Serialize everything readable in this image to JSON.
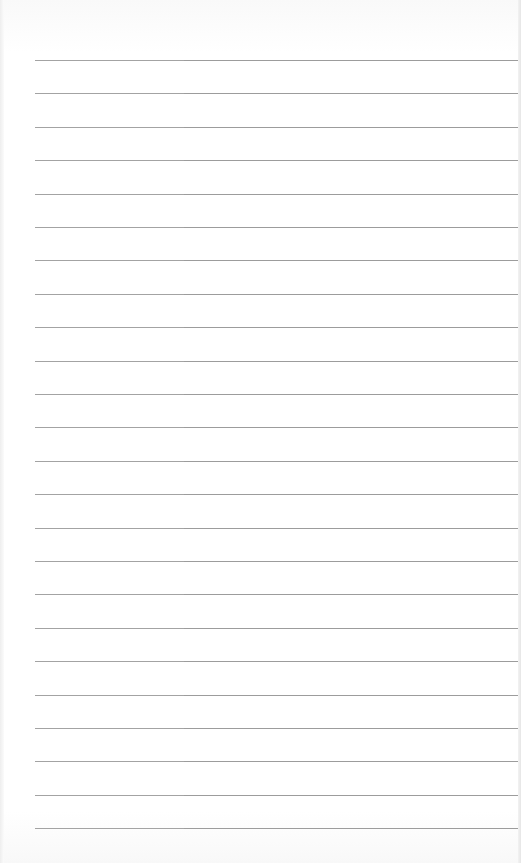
{
  "page": {
    "type": "ruled-notebook-sheet",
    "background_color": "#ffffff",
    "line_color": "#9c9c9c",
    "line_count": 24,
    "first_line_y": 60,
    "line_spacing": 33.4,
    "line_left_x": 35,
    "line_right_x": 518,
    "text_content": []
  }
}
